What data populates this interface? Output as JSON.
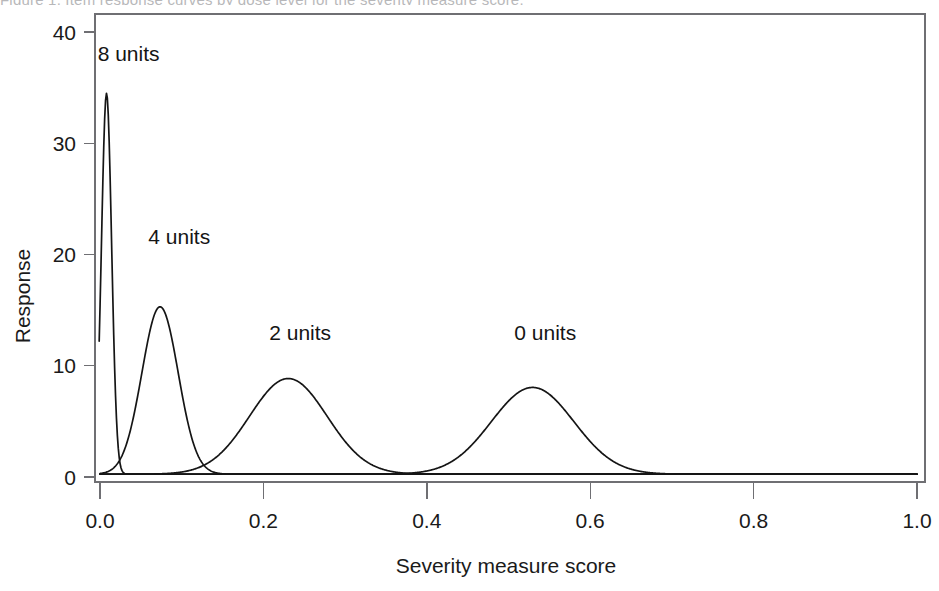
{
  "figure": {
    "caption_sliver": "Figure 1. Item response curves by dose level for the severity measure score.",
    "background": "#ffffff",
    "curve_color": "#151515",
    "axis_color": "#6f6f73"
  },
  "chart_data": {
    "type": "line",
    "title": "",
    "xlabel": "Severity measure score",
    "ylabel": "Response",
    "xlim": [
      0,
      1
    ],
    "ylim": [
      0,
      41
    ],
    "grid": false,
    "legend": "inline-annotations",
    "xticks": [
      0,
      0.2,
      0.4,
      0.6,
      0.8,
      1
    ],
    "xticklabels": [
      "0.0",
      "0.2",
      "0.4",
      "0.6",
      "0.8",
      "1.0"
    ],
    "yticks": [
      0,
      10,
      20,
      30,
      40
    ],
    "yticklabels": [
      "0",
      "10",
      "20",
      "30",
      "40"
    ],
    "series": [
      {
        "name": "8 units",
        "label": "8 units",
        "peak_x": 0.008,
        "peak_y": 34.5,
        "sigma": 0.0062,
        "baseline": 0.25,
        "label_x": 0.035,
        "label_y": 38.0,
        "truncated_left": true,
        "left_truncation_value": 12.2
      },
      {
        "name": "4 units",
        "label": "4 units",
        "peak_x": 0.0735,
        "peak_y": 15.3,
        "sigma": 0.0222,
        "baseline": 0.25,
        "label_x": 0.097,
        "label_y": 21.6,
        "truncated_left": false
      },
      {
        "name": "2 units",
        "label": "2 units",
        "peak_x": 0.2305,
        "peak_y": 8.85,
        "sigma": 0.0475,
        "baseline": 0.25,
        "label_x": 0.245,
        "label_y": 12.9,
        "truncated_left": false
      },
      {
        "name": "0 units",
        "label": "0 units",
        "peak_x": 0.5295,
        "peak_y": 8.05,
        "sigma": 0.0505,
        "baseline": 0.25,
        "label_x": 0.545,
        "label_y": 12.9,
        "truncated_left": false
      }
    ]
  }
}
